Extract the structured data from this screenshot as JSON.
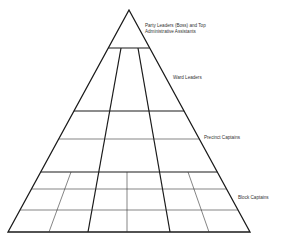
{
  "diagram": {
    "type": "pyramid",
    "title": "",
    "levels": [
      {
        "label": "Party Leaders (Boss) and Top Administrative Assistants",
        "line1": "Party Leaders (Boss) and Top",
        "line2": "Administrative Assistants"
      },
      {
        "label": "Ward Leaders"
      },
      {
        "label": "Precinct Captains"
      },
      {
        "label": "Block Captains"
      }
    ],
    "colors": {
      "stroke": "#1a1a1a",
      "light_stroke": "#333333",
      "text": "#333333",
      "background": "#ffffff"
    }
  }
}
